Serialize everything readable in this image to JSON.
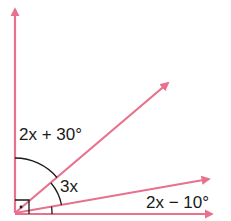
{
  "diagram": {
    "type": "angle-diagram",
    "colors": {
      "ray": "#e8718d",
      "arc": "#1a1a1a",
      "text": "#1a1a1a",
      "background": "#ffffff"
    },
    "rays": [
      {
        "id": "vertical",
        "direction": "up"
      },
      {
        "id": "upper-diagonal",
        "direction": "up-right"
      },
      {
        "id": "shallow-diagonal",
        "direction": "right-slightly-up"
      },
      {
        "id": "horizontal",
        "direction": "right"
      }
    ],
    "right_angle_marker": true,
    "labels": {
      "angle_top": "2x + 30°",
      "angle_middle": "3x",
      "angle_bottom": "2x − 10°"
    }
  }
}
